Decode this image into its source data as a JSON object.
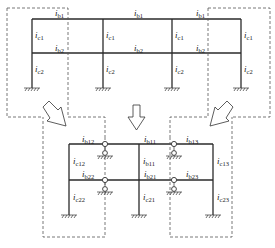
{
  "diagram": {
    "top_frame": {
      "beam_labels_story1": [
        {
          "i": "i",
          "sub": "b1"
        },
        {
          "i": "i",
          "sub": "b1"
        },
        {
          "i": "i",
          "sub": "b1"
        }
      ],
      "beam_labels_story2": [
        {
          "i": "i",
          "sub": "b2"
        },
        {
          "i": "i",
          "sub": "b2"
        },
        {
          "i": "i",
          "sub": "b2"
        }
      ],
      "column_labels_upper": [
        {
          "i": "i",
          "sub": "c1"
        },
        {
          "i": "i",
          "sub": "c1"
        },
        {
          "i": "i",
          "sub": "c1"
        },
        {
          "i": "i",
          "sub": "c1"
        }
      ],
      "column_labels_lower": [
        {
          "i": "i",
          "sub": "c2"
        },
        {
          "i": "i",
          "sub": "c2"
        },
        {
          "i": "i",
          "sub": "c2"
        },
        {
          "i": "i",
          "sub": "c2"
        }
      ]
    },
    "bottom_frame": {
      "beam_labels_story1": [
        {
          "i": "i",
          "sub": "b12"
        },
        {
          "i": "i",
          "sub": "b11"
        },
        {
          "i": "i",
          "sub": "b13"
        }
      ],
      "beam_labels_story2": [
        {
          "i": "i",
          "sub": "b22"
        },
        {
          "i": "i",
          "sub": "b21"
        },
        {
          "i": "i",
          "sub": "b23"
        }
      ],
      "column_labels_upper": [
        {
          "i": "i",
          "sub": "c12"
        },
        {
          "i": "i",
          "sub": "b11"
        },
        {
          "i": "i",
          "sub": "c13"
        }
      ],
      "column_labels_lower": [
        {
          "i": "i",
          "sub": "c22"
        },
        {
          "i": "i",
          "sub": "c21"
        },
        {
          "i": "i",
          "sub": "c23"
        }
      ]
    },
    "arrows": [
      "down-right-arrow",
      "down-arrow",
      "down-left-arrow"
    ]
  }
}
